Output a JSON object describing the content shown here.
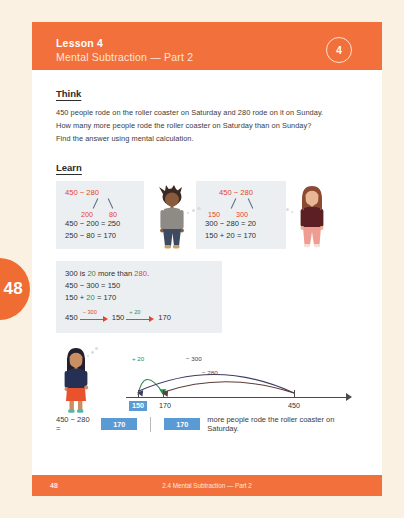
{
  "page": {
    "tab_number": "48",
    "footer_page": "48",
    "footer_title": "2.4 Mental Subtraction — Part 2"
  },
  "header": {
    "lesson_label": "Lesson 4",
    "lesson_title": "Mental Subtraction — Part 2",
    "badge": "4"
  },
  "think": {
    "heading": "Think",
    "lines": [
      "450 people rode on the roller coaster on Saturday and 280 rode on it on Sunday.",
      "How many more people rode the roller coaster on Saturday than on Sunday?",
      "Find the answer using mental calculation."
    ]
  },
  "learn": {
    "heading": "Learn",
    "box1": {
      "bond_top": "450 − 280",
      "bond_left": "200",
      "bond_right": "80",
      "line1": "450 − 200 = 250",
      "line2": "250 − 80 = 170"
    },
    "box2": {
      "bond_top": "450 − 280",
      "bond_left": "150",
      "bond_right": "300",
      "line1": "300 − 280 = 20",
      "line2": "150 + 20 = 170"
    },
    "box3": {
      "line1_a": "300 is ",
      "line1_b": "20",
      "line1_c": " more than ",
      "line1_d": "280",
      "line1_e": ".",
      "line2": "450 − 300 = 150",
      "line3_a": "150 + ",
      "line3_b": "20",
      "line3_c": " = 170",
      "chain_start": "450",
      "chain_mid": "150",
      "chain_end": "170",
      "chain_label1": "− 300",
      "chain_label2": "+ 20"
    }
  },
  "numberline": {
    "tick_150": "150",
    "tick_170": "170",
    "tick_450": "450",
    "arc_plus20": "+ 20",
    "arc_minus300": "− 300",
    "arc_minus280": "− 280"
  },
  "answer": {
    "equation_prefix": "450 − 280 = ",
    "equation_blank": "170",
    "sentence_blank": "170",
    "sentence_text": "more people rode the roller coaster on Saturday."
  },
  "colors": {
    "brand_orange": "#f1703c",
    "tab_orange": "#ef6c33",
    "page_cream": "#fbf1e2",
    "box_gray": "#eceff1",
    "accent_red": "#e2452e",
    "accent_green": "#2e8b4f",
    "blank_blue": "#5b9bd5",
    "arc_navy": "#3d3a63",
    "arc_brown": "#5c3b38"
  }
}
